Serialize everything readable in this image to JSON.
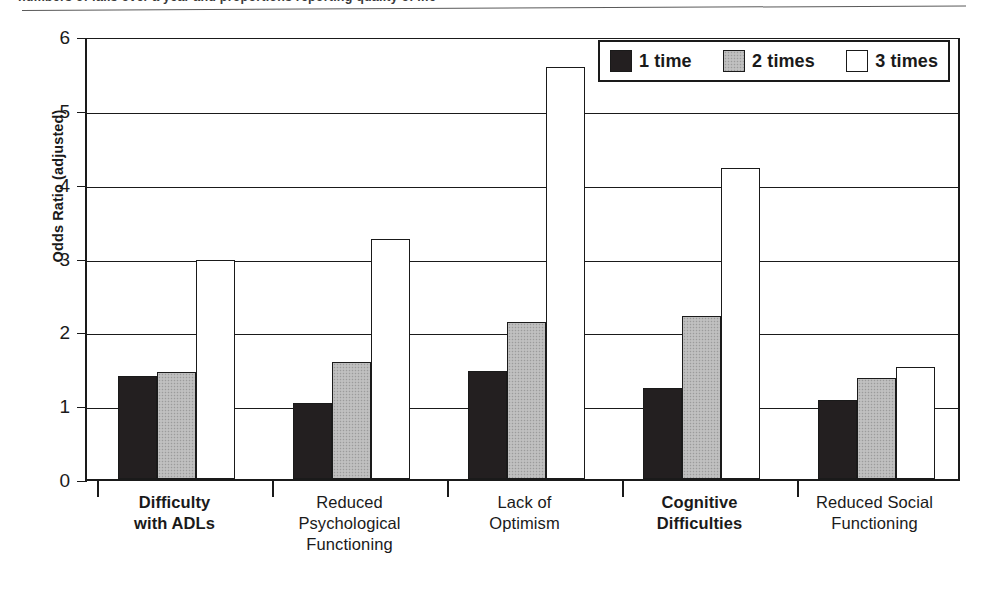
{
  "caption": {
    "top_cut_text": "numbers of falls over a year and proportions reporting quality of life"
  },
  "chart_data": {
    "type": "bar",
    "title": "",
    "xlabel": "",
    "ylabel": "Odds Ratio (adjusted)",
    "ylim": [
      0,
      6
    ],
    "yticks": [
      0,
      1,
      2,
      3,
      4,
      5,
      6
    ],
    "ytick_labels": [
      "0",
      "1",
      "2",
      "3",
      "4",
      "5",
      "6"
    ],
    "grid": true,
    "legend_position": "top-right",
    "categories": [
      "Difficulty\nwith ADLs",
      "Reduced\nPsychological\nFunctioning",
      "Lack of\nOptimism",
      "Cognitive\nDifficulties",
      "Reduced Social\nFunctioning"
    ],
    "category_lines": [
      [
        "Difficulty",
        "with ADLs"
      ],
      [
        "Reduced",
        "Psychological",
        "Functioning"
      ],
      [
        "Lack of",
        "Optimism"
      ],
      [
        "Cognitive",
        "Difficulties"
      ],
      [
        "Reduced Social",
        "Functioning"
      ]
    ],
    "category_emphasis": [
      "bold",
      "normal",
      "normal",
      "bold",
      "normal"
    ],
    "series": [
      {
        "name": "1 time",
        "color": "#231f20",
        "values": [
          1.4,
          1.03,
          1.46,
          1.23,
          1.07
        ]
      },
      {
        "name": "2 times",
        "color": "#b9b9b9",
        "values": [
          1.45,
          1.58,
          2.12,
          2.21,
          1.37
        ]
      },
      {
        "name": "3 times",
        "color": "#ffffff",
        "values": [
          2.96,
          3.25,
          5.58,
          4.21,
          1.52
        ]
      }
    ]
  },
  "legend": {
    "entries": [
      {
        "label": "1 time",
        "swatch": "black"
      },
      {
        "label": "2 times",
        "swatch": "gray"
      },
      {
        "label": "3 times",
        "swatch": "white"
      }
    ]
  },
  "colors": {
    "series_1": "#231f20",
    "series_2": "#b9b9b9",
    "series_3": "#ffffff",
    "axis": "#1a1a1a",
    "background": "#ffffff"
  }
}
